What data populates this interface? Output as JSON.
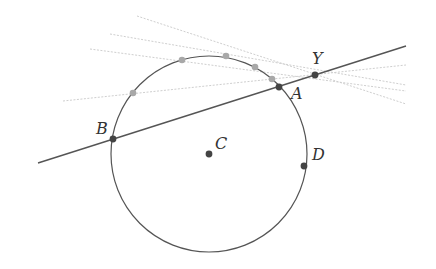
{
  "diagram": {
    "title": "",
    "circle": {
      "center": "C",
      "cx": 209,
      "cy": 154,
      "r": 98,
      "color": "#555555"
    },
    "main_line": {
      "x1": 38,
      "y1": 163,
      "x2": 406,
      "y2": 46,
      "color": "#555555",
      "through": [
        "B",
        "A",
        "Y"
      ]
    },
    "points": [
      {
        "label": "Y",
        "x": 315,
        "y": 75,
        "lx": 312,
        "ly": 64
      },
      {
        "label": "A",
        "x": 279,
        "y": 87,
        "lx": 291,
        "ly": 99
      },
      {
        "label": "B",
        "x": 113,
        "y": 139,
        "lx": 96,
        "ly": 134
      },
      {
        "label": "C",
        "x": 209,
        "y": 154,
        "lx": 215,
        "ly": 149
      },
      {
        "label": "D",
        "x": 304,
        "y": 166,
        "lx": 312,
        "ly": 160
      }
    ],
    "point_color": "#444444",
    "grey_points": [
      {
        "x": 133,
        "y": 93
      },
      {
        "x": 182,
        "y": 60
      },
      {
        "x": 226,
        "y": 56
      },
      {
        "x": 255,
        "y": 67
      },
      {
        "x": 272,
        "y": 79
      }
    ],
    "grey_point_color": "#a8a8a8",
    "dashed_lines": [
      {
        "x1": 63,
        "y1": 101,
        "x2": 406,
        "y2": 65
      },
      {
        "x1": 90,
        "y1": 49,
        "x2": 406,
        "y2": 91
      },
      {
        "x1": 110,
        "y1": 34,
        "x2": 406,
        "y2": 85
      },
      {
        "x1": 137,
        "y1": 16,
        "x2": 406,
        "y2": 104
      }
    ],
    "dashed_color": "#cfcfcf"
  }
}
